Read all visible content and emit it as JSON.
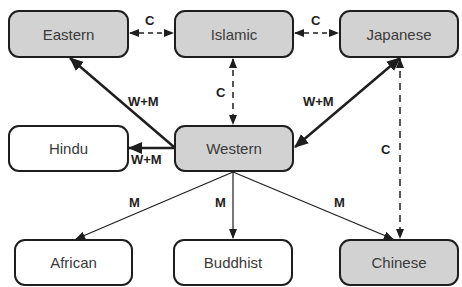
{
  "diagram": {
    "nodes": [
      {
        "id": "eastern",
        "label": "Eastern",
        "fill": "gray"
      },
      {
        "id": "islamic",
        "label": "Islamic",
        "fill": "gray"
      },
      {
        "id": "japanese",
        "label": "Japanese",
        "fill": "gray"
      },
      {
        "id": "hindu",
        "label": "Hindu",
        "fill": "white"
      },
      {
        "id": "western",
        "label": "Western",
        "fill": "gray"
      },
      {
        "id": "african",
        "label": "African",
        "fill": "white"
      },
      {
        "id": "buddhist",
        "label": "Buddhist",
        "fill": "white"
      },
      {
        "id": "chinese",
        "label": "Chinese",
        "fill": "gray"
      }
    ],
    "edges": [
      {
        "from": "eastern",
        "to": "islamic",
        "label": "C",
        "style": "dashed",
        "direction": "both"
      },
      {
        "from": "islamic",
        "to": "japanese",
        "label": "C",
        "style": "dashed",
        "direction": "both"
      },
      {
        "from": "islamic",
        "to": "western",
        "label": "C",
        "style": "dashed",
        "direction": "both"
      },
      {
        "from": "japanese",
        "to": "chinese",
        "label": "C",
        "style": "dashed",
        "direction": "both"
      },
      {
        "from": "western",
        "to": "eastern",
        "label": "W+M",
        "style": "thick",
        "direction": "forward"
      },
      {
        "from": "western",
        "to": "japanese",
        "label": "W+M",
        "style": "thick",
        "direction": "both"
      },
      {
        "from": "western",
        "to": "hindu",
        "label": "W+M",
        "style": "thick",
        "direction": "forward"
      },
      {
        "from": "western",
        "to": "african",
        "label": "M",
        "style": "thin",
        "direction": "forward"
      },
      {
        "from": "western",
        "to": "buddhist",
        "label": "M",
        "style": "thin",
        "direction": "forward"
      },
      {
        "from": "western",
        "to": "chinese",
        "label": "M",
        "style": "thin",
        "direction": "forward"
      }
    ],
    "colors": {
      "gray_fill": "#d2d2d2",
      "white_fill": "#ffffff",
      "stroke": "#1e1e1e",
      "text": "#3a3a3a"
    }
  }
}
